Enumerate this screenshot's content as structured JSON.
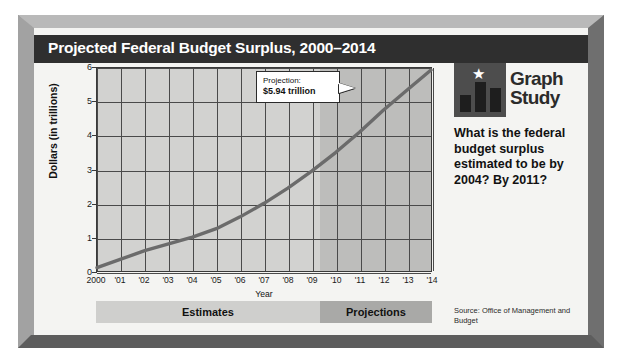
{
  "title": "Projected Federal Budget Surplus, 2000–2014",
  "chart_data": {
    "type": "line",
    "title": "Projected Federal Budget Surplus, 2000–2014",
    "xlabel": "Year",
    "ylabel": "Dollars (in trillions)",
    "xlim": [
      2000,
      2014
    ],
    "ylim": [
      0,
      6
    ],
    "grid": true,
    "legend": "none",
    "x_tick_labels": [
      "2000",
      "'01",
      "'02",
      "'03",
      "'04",
      "'05",
      "'06",
      "'07",
      "'08",
      "'09",
      "'10",
      "'11",
      "'12",
      "'13",
      "'14"
    ],
    "x": [
      2000,
      2001,
      2002,
      2003,
      2004,
      2005,
      2006,
      2007,
      2008,
      2009,
      2010,
      2011,
      2012,
      2013,
      2014
    ],
    "y_tick_labels": [
      "0",
      "1",
      "2",
      "3",
      "4",
      "5",
      "6"
    ],
    "y_ticks": [
      0,
      1,
      2,
      3,
      4,
      5,
      6
    ],
    "series": [
      {
        "name": "Projected federal budget surplus",
        "values": [
          0.1,
          0.35,
          0.6,
          0.8,
          1.0,
          1.25,
          1.6,
          2.0,
          2.45,
          2.95,
          3.5,
          4.1,
          4.75,
          5.35,
          5.94
        ],
        "color": "#6b6b6b"
      }
    ],
    "annotations": [
      {
        "label_line1": "Projection:",
        "label_line2": "$5.94 trillion",
        "points_to_x": 2014,
        "points_to_y": 5.94
      }
    ],
    "bands": [
      {
        "label": "Estimates",
        "from_x": 2000,
        "to_x": 2010
      },
      {
        "label": "Projections",
        "from_x": 2010,
        "to_x": 2014
      }
    ]
  },
  "callout": {
    "line1": "Projection:",
    "line2": "$5.94 trillion"
  },
  "axes": {
    "y_title": "Dollars (in trillions)",
    "x_title": "Year"
  },
  "bands": {
    "estimates_label": "Estimates",
    "projections_label": "Projections"
  },
  "side_panel": {
    "logo_line1": "Graph",
    "logo_line2": "Study",
    "star_glyph": "★",
    "question": "What is the federal budget surplus estimated to be by 2004? By 2011?",
    "source": "Source: Office of Management and Budget"
  },
  "colors": {
    "title_bar": "#2f2f2f",
    "plot_background": "#d2d2d0",
    "projection_shade": "#bdbdbb",
    "curve": "#6b6b6b",
    "frame": "#8e8e8e"
  }
}
